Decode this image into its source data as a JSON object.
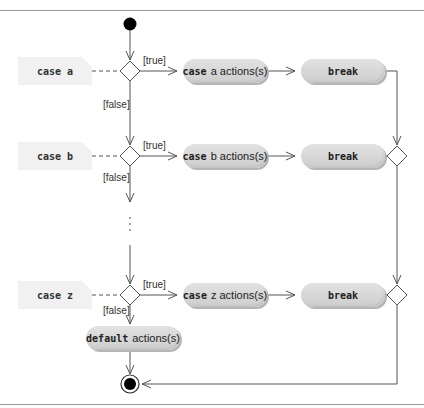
{
  "diagram": {
    "type": "UML activity diagram",
    "cases": [
      {
        "note": "case a",
        "keyword": "case",
        "action_label": "a actions(s)",
        "break_label": "break",
        "true_guard": "[true]",
        "false_guard": "[false]"
      },
      {
        "note": "case b",
        "keyword": "case",
        "action_label": "b actions(s)",
        "break_label": "break",
        "true_guard": "[true]",
        "false_guard": "[false]"
      },
      {
        "note": "case z",
        "keyword": "case",
        "action_label": "z actions(s)",
        "break_label": "break",
        "true_guard": "[true]",
        "false_guard": "[false]"
      }
    ],
    "ellipsis": "⋮",
    "default_action": {
      "keyword": "default",
      "label": "actions(s)"
    },
    "nodes": {
      "initial": "initial-node",
      "final": "final-node"
    },
    "colors": {
      "line": "#555555",
      "pill_fill": "#d6d6d6",
      "note_fill": "#f1f1f1",
      "border": "#9a9a9a"
    }
  }
}
